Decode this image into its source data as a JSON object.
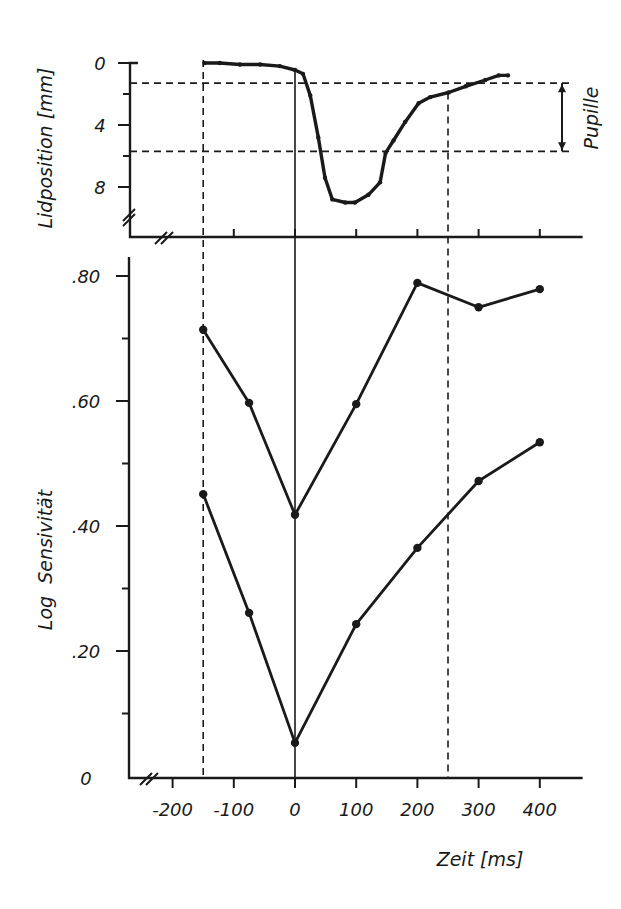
{
  "chart_data": [
    {
      "type": "line",
      "panel": "top",
      "title": "",
      "xlabel": "",
      "ylabel": "Lidposition [mm]",
      "yticks": [
        "0",
        "4",
        "8"
      ],
      "ylim": [
        0,
        10
      ],
      "y_inverted": true,
      "xlim": [
        -270,
        470
      ],
      "annotation": "Pupille",
      "pupil_range_mm": [
        1.3,
        5.7
      ],
      "series": [
        {
          "name": "Lidposition",
          "x": [
            -148,
            -123,
            -90,
            -57,
            -25,
            0,
            13,
            25,
            38,
            49,
            61,
            82,
            98,
            120,
            139,
            148,
            161,
            180,
            202,
            221,
            251,
            279,
            311,
            333,
            348
          ],
          "values": [
            0,
            0,
            0.1,
            0.1,
            0.2,
            0.45,
            0.7,
            2.1,
            4.8,
            7.4,
            8.8,
            9.0,
            9.0,
            8.5,
            7.7,
            5.8,
            5.0,
            3.8,
            2.6,
            2.2,
            1.9,
            1.5,
            1.1,
            0.8,
            0.8
          ]
        }
      ],
      "reference_lines_ms": [
        -150,
        0,
        250
      ]
    },
    {
      "type": "line",
      "panel": "bottom",
      "title": "",
      "xlabel": "Zeit [ms]",
      "ylabel": "Log  Sensivität",
      "xticks": [
        "-200",
        "-100",
        "0",
        "100",
        "200",
        "300",
        "400"
      ],
      "xtick_values": [
        -200,
        -100,
        0,
        100,
        200,
        300,
        400
      ],
      "yticks": [
        ".80",
        ".60",
        ".40",
        ".20",
        "0"
      ],
      "ytick_values": [
        0.8,
        0.6,
        0.4,
        0.2,
        0
      ],
      "ylim": [
        0,
        0.85
      ],
      "xlim": [
        -270,
        470
      ],
      "x": [
        -150,
        -75,
        0,
        100,
        200,
        300,
        400
      ],
      "series": [
        {
          "name": "upper",
          "values": [
            0.714,
            0.597,
            0.418,
            0.595,
            0.789,
            0.75,
            0.779
          ]
        },
        {
          "name": "lower",
          "values": [
            0.451,
            0.261,
            0.053,
            0.243,
            0.365,
            0.472,
            0.534
          ]
        }
      ],
      "reference_lines_ms": [
        -150,
        0,
        250
      ]
    }
  ]
}
